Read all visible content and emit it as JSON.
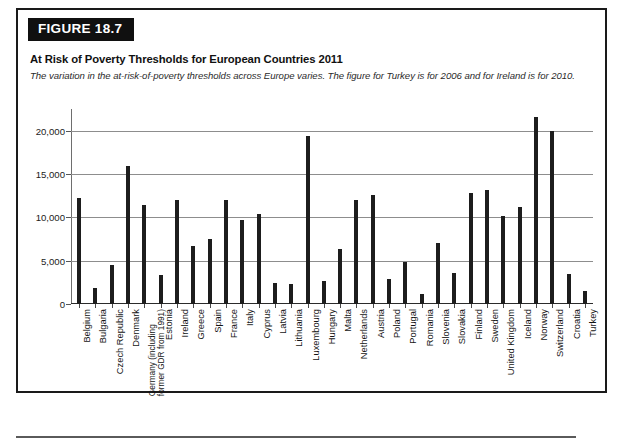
{
  "figure": {
    "number_label": "FIGURE 18.7",
    "title": "At Risk of Poverty Thresholds for European Countries 2011",
    "subtitle": "The variation in the at-risk-of-poverty thresholds across Europe varies. The figure for Turkey is for 2006 and for Ireland is for 2010."
  },
  "colors": {
    "bar": "#1d1d1d",
    "grid": "#8d8d8d",
    "banner_bg": "#101010",
    "banner_text": "#ffffff",
    "frame": "#1a1a1a"
  },
  "chart_data": {
    "type": "bar",
    "title": "At Risk of Poverty Thresholds for European Countries 2011",
    "subtitle": "The variation in the at-risk-of-poverty thresholds across Europe varies. The figure for Turkey is for 2006 and for Ireland is for 2010.",
    "xlabel": "",
    "ylabel": "",
    "ylim": [
      0,
      22500
    ],
    "yticks": [
      0,
      5000,
      10000,
      15000,
      20000
    ],
    "ytick_labels": [
      "0",
      "5,000",
      "10,000",
      "15,000",
      "20,000"
    ],
    "grid": true,
    "legend": false,
    "categories": [
      "Belgium",
      "Bulgaria",
      "Czech Republic",
      "Denmark",
      "Germany (including former GDR from 1991)",
      "Estonia",
      "Ireland",
      "Greece",
      "Spain",
      "France",
      "Italy",
      "Cyprus",
      "Latvia",
      "Lithuania",
      "Luxembourg",
      "Hungary",
      "Malta",
      "Netherlands",
      "Austria",
      "Poland",
      "Portugal",
      "Romania",
      "Slovenia",
      "Slovakia",
      "Finland",
      "Sweden",
      "United Kingdom",
      "Iceland",
      "Norway",
      "Switzerland",
      "Croatia",
      "Turkey"
    ],
    "values": [
      12200,
      1800,
      4450,
      15900,
      11400,
      3400,
      11950,
      6650,
      7550,
      12050,
      9650,
      10400,
      2400,
      2300,
      19400,
      2600,
      6350,
      12050,
      12600,
      2900,
      4800,
      1200,
      7050,
      3550,
      12800,
      13150,
      10100,
      11150,
      21600,
      20000,
      3500,
      1450
    ]
  }
}
